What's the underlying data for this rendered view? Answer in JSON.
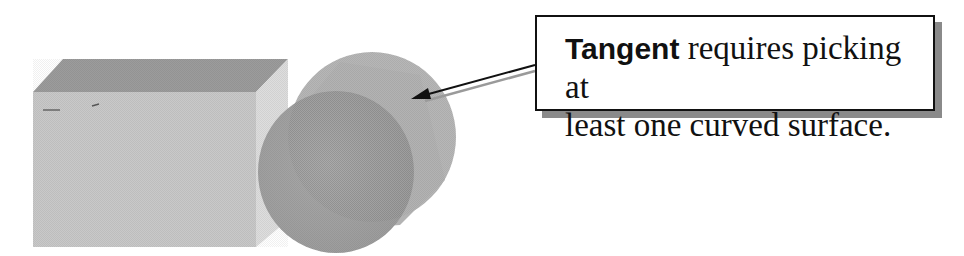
{
  "figure": {
    "shapes": [
      {
        "name": "block",
        "type": "box"
      },
      {
        "name": "cylinder",
        "type": "cylinder"
      }
    ]
  },
  "callout": {
    "keyword": "Tangent",
    "text_line1": " requires picking at",
    "text_line2": "least one curved surface."
  },
  "colors": {
    "block_front": "#c8c8c8",
    "block_top": "#9a9a9a",
    "block_side": "#dcdcdc",
    "cylinder_front": "#a5a5a5",
    "cylinder_body": "#b8b8b8",
    "arrow": "#111111",
    "shadow": "#8a8a8a"
  }
}
